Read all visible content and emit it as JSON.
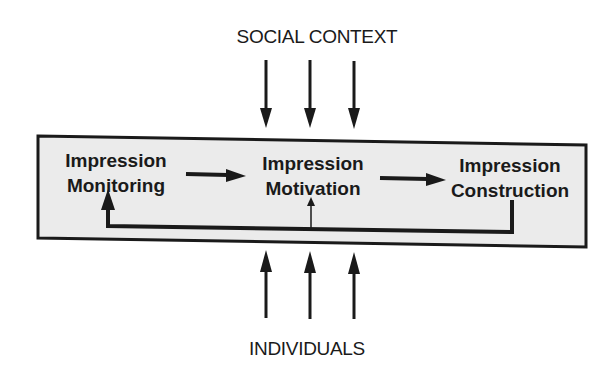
{
  "diagram": {
    "top_label": "SOCIAL CONTEXT",
    "bottom_label": "INDIVIDUALS",
    "nodes": [
      {
        "line1": "Impression",
        "line2": "Monitoring"
      },
      {
        "line1": "Impression",
        "line2": "Motivation"
      },
      {
        "line1": "Impression",
        "line2": "Construction"
      }
    ],
    "colors": {
      "box_fill": "#ebebeb",
      "stroke": "#1a1a1a",
      "background": "#ffffff"
    }
  }
}
